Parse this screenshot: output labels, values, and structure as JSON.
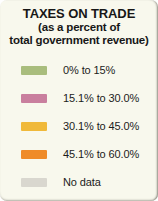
{
  "legend": {
    "title": "TAXES ON TRADE",
    "subtitle_line1": "(as a percent of",
    "subtitle_line2": "total government revenue)",
    "background_color": "#f8f8ed",
    "text_color": "#171717"
  },
  "chart_data": {
    "type": "table",
    "title": "TAXES ON TRADE",
    "subtitle": "(as a percent of total government revenue)",
    "xlabel": "",
    "ylabel": "",
    "legend_position": "standalone",
    "grid": false,
    "categories": [
      "0% to 15%",
      "15.1% to 30.0%",
      "30.1% to 45.0%",
      "45.1% to 60.0%",
      "No data"
    ],
    "series": [
      {
        "name": "Taxes on trade (% of total government revenue)",
        "values": [
          7.5,
          22.55,
          37.55,
          52.55,
          null
        ]
      }
    ],
    "bins": [
      {
        "label": "0% to 15%",
        "color": "#a9bd7d",
        "min": 0,
        "max": 15.0
      },
      {
        "label": "15.1% to 30.0%",
        "color": "#c97f9e",
        "min": 15.1,
        "max": 30.0
      },
      {
        "label": "30.1% to 45.0%",
        "color": "#f0b93a",
        "min": 30.1,
        "max": 45.0
      },
      {
        "label": "45.1% to 60.0%",
        "color": "#ef8b28",
        "min": 45.1,
        "max": 60.0
      },
      {
        "label": "No data",
        "color": "#d9d7cf",
        "min": null,
        "max": null
      }
    ]
  }
}
